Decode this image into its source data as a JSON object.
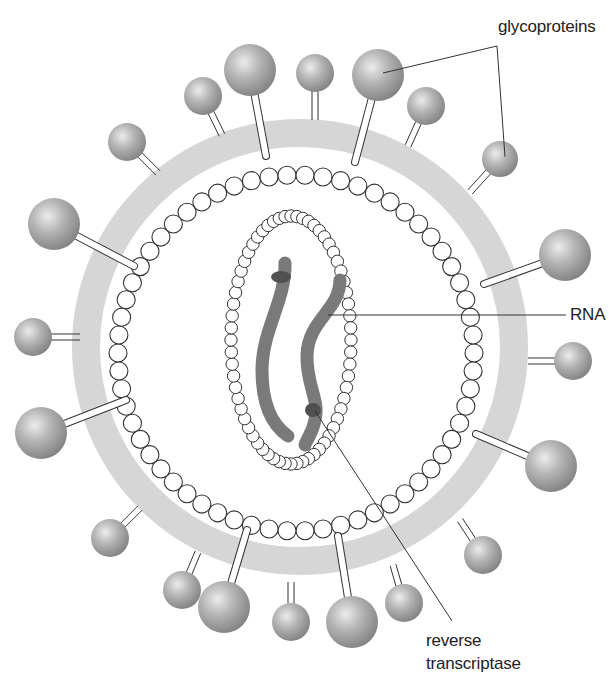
{
  "diagram": {
    "labels": {
      "glycoproteins": "glycoproteins",
      "rna": "RNA",
      "reverse_transcriptase_line1": "reverse",
      "reverse_transcriptase_line2": "transcriptase"
    },
    "colors": {
      "membrane": "#d6d6d6",
      "sphere_light": "#e6e6e6",
      "sphere_dark": "#8a8a8a",
      "rna": "#777777",
      "enzyme": "#555555",
      "bead_stroke": "#333333",
      "leader_line": "#333333"
    },
    "geometry": {
      "center": [
        300,
        347
      ],
      "membrane_outer_radius": 228,
      "membrane_inner_radius": 200,
      "capsid_radius": 178,
      "core_center": [
        291,
        340
      ],
      "core_rx": 60,
      "core_ry": 124
    },
    "glycoproteins": [
      {
        "x": 250,
        "y": 70,
        "r": 26,
        "stalk_end": [
          266,
          156
        ],
        "type": "single"
      },
      {
        "x": 315,
        "y": 73,
        "r": 19,
        "stalk_end": [
          315,
          120
        ],
        "type": "double"
      },
      {
        "x": 378,
        "y": 75,
        "r": 26,
        "stalk_end": [
          355,
          162
        ],
        "type": "single"
      },
      {
        "x": 426,
        "y": 106,
        "r": 19,
        "stalk_end": [
          408,
          146
        ],
        "type": "double"
      },
      {
        "x": 500,
        "y": 159,
        "r": 18,
        "stalk_end": [
          470,
          192
        ],
        "type": "double"
      },
      {
        "x": 565,
        "y": 255,
        "r": 26,
        "stalk_end": [
          484,
          284
        ],
        "type": "single"
      },
      {
        "x": 573,
        "y": 361,
        "r": 19,
        "stalk_end": [
          528,
          361
        ],
        "type": "double"
      },
      {
        "x": 551,
        "y": 466,
        "r": 26,
        "stalk_end": [
          476,
          434
        ],
        "type": "single"
      },
      {
        "x": 483,
        "y": 555,
        "r": 19,
        "stalk_end": [
          460,
          520
        ],
        "type": "double"
      },
      {
        "x": 404,
        "y": 603,
        "r": 19,
        "stalk_end": [
          393,
          565
        ],
        "type": "double"
      },
      {
        "x": 352,
        "y": 622,
        "r": 26,
        "stalk_end": [
          338,
          536
        ],
        "type": "single"
      },
      {
        "x": 291,
        "y": 622,
        "r": 19,
        "stalk_end": [
          291,
          582
        ],
        "type": "double"
      },
      {
        "x": 224,
        "y": 607,
        "r": 26,
        "stalk_end": [
          247,
          530
        ],
        "type": "single"
      },
      {
        "x": 182,
        "y": 590,
        "r": 19,
        "stalk_end": [
          198,
          552
        ],
        "type": "double"
      },
      {
        "x": 110,
        "y": 538,
        "r": 19,
        "stalk_end": [
          140,
          508
        ],
        "type": "double"
      },
      {
        "x": 41,
        "y": 433,
        "r": 26,
        "stalk_end": [
          126,
          400
        ],
        "type": "single"
      },
      {
        "x": 33,
        "y": 337,
        "r": 19,
        "stalk_end": [
          80,
          337
        ],
        "type": "double"
      },
      {
        "x": 54,
        "y": 224,
        "r": 26,
        "stalk_end": [
          134,
          266
        ],
        "type": "single"
      },
      {
        "x": 127,
        "y": 142,
        "r": 19,
        "stalk_end": [
          158,
          173
        ],
        "type": "double"
      },
      {
        "x": 203,
        "y": 96,
        "r": 19,
        "stalk_end": [
          222,
          135
        ],
        "type": "double"
      }
    ],
    "leaders": {
      "glycoproteins": {
        "text_anchor": [
          497,
          46
        ],
        "points": [
          [
            380,
            72
          ],
          [
            498,
            46
          ],
          [
            504,
            157
          ]
        ]
      },
      "rna": {
        "points": [
          [
            326,
            315
          ],
          [
            565,
            315
          ]
        ]
      },
      "reverse_transcriptase": {
        "points": [
          [
            313,
            410
          ],
          [
            451,
            620
          ]
        ]
      }
    }
  }
}
